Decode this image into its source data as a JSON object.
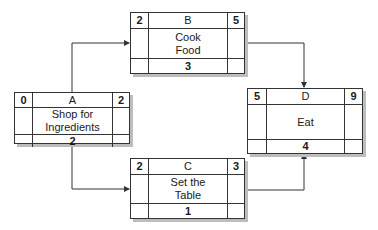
{
  "diagram": {
    "type": "activity-on-node network",
    "nodes": [
      {
        "id": "A",
        "label": "Shop for Ingredients",
        "label_lines": [
          "Shop for",
          "Ingredients"
        ],
        "early_start": "0",
        "early_finish": "2",
        "duration": "2"
      },
      {
        "id": "B",
        "label": "Cook Food",
        "label_lines": [
          "Cook",
          "Food"
        ],
        "early_start": "2",
        "early_finish": "5",
        "duration": "3"
      },
      {
        "id": "C",
        "label": "Set the Table",
        "label_lines": [
          "Set the",
          "Table"
        ],
        "early_start": "2",
        "early_finish": "3",
        "duration": "1"
      },
      {
        "id": "D",
        "label": "Eat",
        "label_lines": [
          "Eat"
        ],
        "early_start": "5",
        "early_finish": "9",
        "duration": "4"
      }
    ],
    "edges": [
      {
        "from": "A",
        "to": "B"
      },
      {
        "from": "A",
        "to": "C"
      },
      {
        "from": "B",
        "to": "D"
      },
      {
        "from": "C",
        "to": "D"
      }
    ]
  },
  "nodes": {
    "A": {
      "id": "A",
      "es": "0",
      "ef": "2",
      "line1": "Shop for",
      "line2": "Ingredients",
      "dur": "2"
    },
    "B": {
      "id": "B",
      "es": "2",
      "ef": "5",
      "line1": "Cook",
      "line2": "Food",
      "dur": "3"
    },
    "C": {
      "id": "C",
      "es": "2",
      "ef": "3",
      "line1": "Set the",
      "line2": "Table",
      "dur": "1"
    },
    "D": {
      "id": "D",
      "es": "5",
      "ef": "9",
      "line1": "Eat",
      "dur": "4"
    }
  }
}
